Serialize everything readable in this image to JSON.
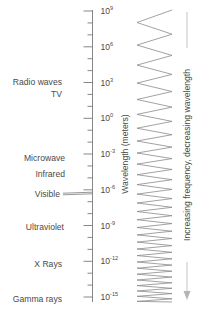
{
  "axis": {
    "title": "Wavelength (meters)",
    "x": 92.5,
    "y_top": 10,
    "y_bottom": 302,
    "major_ticks": [
      {
        "base": "10",
        "exp": "9",
        "y": 11
      },
      {
        "base": "10",
        "exp": "6",
        "y": 46.8
      },
      {
        "base": "10",
        "exp": "3",
        "y": 82.5
      },
      {
        "base": "10",
        "exp": "0",
        "y": 118.3
      },
      {
        "base": "10",
        "exp": "-3",
        "y": 154
      },
      {
        "base": "10",
        "exp": "-6",
        "y": 189.8
      },
      {
        "base": "10",
        "exp": "-9",
        "y": 225.5
      },
      {
        "base": "10",
        "exp": "-12",
        "y": 261.3
      },
      {
        "base": "10",
        "exp": "-15",
        "y": 297
      }
    ]
  },
  "bands": [
    {
      "name": "Radio waves",
      "y": 82,
      "anchor_x": 62
    },
    {
      "name": "TV",
      "y": 94,
      "anchor_x": 62
    },
    {
      "name": "Microwave",
      "y": 158,
      "anchor_x": 65
    },
    {
      "name": "Infrared",
      "y": 174,
      "anchor_x": 65
    },
    {
      "name": "Visible",
      "y": 194,
      "anchor_x": 60,
      "pointer": true
    },
    {
      "name": "Ultraviolet",
      "y": 227,
      "anchor_x": 64
    },
    {
      "name": "X  Rays",
      "y": 264,
      "anchor_x": 62
    },
    {
      "name": "Gamma rays",
      "y": 299,
      "anchor_x": 62
    }
  ],
  "wave": {
    "x_left": 137,
    "x_right": 172,
    "y_top": 10,
    "y_bottom": 302,
    "start_period": 25,
    "end_period": 5
  },
  "direction_arrow": {
    "label": "Increasing frequency, decreasing wavelength",
    "x": 187,
    "y_top": 12,
    "y_bottom": 300
  },
  "colors": {
    "text": "#4a4a4a",
    "axis": "#6a6a6a",
    "wave": "#8a8a8a",
    "arrow": "#b5b5b5"
  }
}
